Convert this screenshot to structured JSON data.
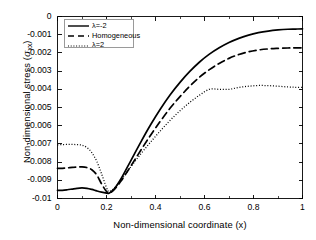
{
  "chart_data": {
    "type": "line",
    "title": "",
    "xlabel": "Non-dimensional coordinate (x)",
    "ylabel_prefix": "Non-dimensional stress (",
    "ylabel_symbol": "σ",
    "ylabel_subscript": "xx",
    "ylabel_suffix": ")",
    "ylabel_full": "Non-dimensional stress (σxx)",
    "xlim": [
      0,
      1
    ],
    "ylim": [
      -0.01,
      0
    ],
    "grid": false,
    "legend_position": "upper left",
    "xticks": [
      "0",
      "0.2",
      "0.4",
      "0.6",
      "0.8",
      "1"
    ],
    "xtick_values": [
      0,
      0.2,
      0.4,
      0.6,
      0.8,
      1
    ],
    "yticks": [
      "0",
      "-0.001",
      "-0.002",
      "-0.003",
      "-0.004",
      "-0.005",
      "-0.006",
      "-0.007",
      "-0.008",
      "-0.009",
      "-0.01"
    ],
    "ytick_values": [
      0,
      -0.001,
      -0.002,
      -0.003,
      -0.004,
      -0.005,
      -0.006,
      -0.007,
      -0.008,
      -0.009,
      -0.01
    ],
    "series": [
      {
        "name": "λ=-2",
        "style": "solid",
        "color": "#000000",
        "x": [
          0,
          0.02,
          0.04,
          0.06,
          0.08,
          0.1,
          0.12,
          0.14,
          0.16,
          0.18,
          0.2,
          0.21,
          0.23,
          0.26,
          0.3,
          0.34,
          0.38,
          0.42,
          0.46,
          0.5,
          0.54,
          0.58,
          0.62,
          0.66,
          0.7,
          0.74,
          0.78,
          0.82,
          0.86,
          0.9,
          0.94,
          0.97,
          1.0
        ],
        "y": [
          -0.00955,
          -0.00955,
          -0.00952,
          -0.00948,
          -0.00944,
          -0.00942,
          -0.00944,
          -0.0095,
          -0.00958,
          -0.00965,
          -0.0097,
          -0.00971,
          -0.0095,
          -0.0089,
          -0.0079,
          -0.0069,
          -0.00595,
          -0.00508,
          -0.0043,
          -0.00362,
          -0.00302,
          -0.0025,
          -0.00207,
          -0.00172,
          -0.00143,
          -0.0012,
          -0.00102,
          -0.00089,
          -0.0008,
          -0.00074,
          -0.0007,
          -0.00069,
          -0.00068
        ]
      },
      {
        "name": "Homogeneous",
        "style": "dashed",
        "color": "#000000",
        "x": [
          0,
          0.02,
          0.04,
          0.06,
          0.08,
          0.1,
          0.12,
          0.14,
          0.16,
          0.18,
          0.2,
          0.21,
          0.23,
          0.26,
          0.3,
          0.34,
          0.38,
          0.42,
          0.46,
          0.5,
          0.54,
          0.58,
          0.62,
          0.66,
          0.7,
          0.74,
          0.78,
          0.82,
          0.86,
          0.9,
          0.94,
          0.97,
          1.0
        ],
        "y": [
          -0.00835,
          -0.00834,
          -0.00832,
          -0.00829,
          -0.00827,
          -0.00826,
          -0.0083,
          -0.00842,
          -0.0087,
          -0.0092,
          -0.00962,
          -0.0097,
          -0.00953,
          -0.00903,
          -0.0082,
          -0.00735,
          -0.00652,
          -0.00575,
          -0.00503,
          -0.0044,
          -0.00383,
          -0.00333,
          -0.00292,
          -0.00258,
          -0.0023,
          -0.00209,
          -0.00194,
          -0.00184,
          -0.00178,
          -0.00175,
          -0.00173,
          -0.00172,
          -0.00172
        ]
      },
      {
        "name": "λ=2",
        "style": "dotted",
        "color": "#000000",
        "x": [
          0,
          0.02,
          0.04,
          0.06,
          0.08,
          0.1,
          0.12,
          0.14,
          0.16,
          0.18,
          0.2,
          0.21,
          0.23,
          0.26,
          0.3,
          0.34,
          0.38,
          0.42,
          0.46,
          0.5,
          0.54,
          0.58,
          0.62,
          0.66,
          0.7,
          0.74,
          0.78,
          0.82,
          0.86,
          0.9,
          0.94,
          0.97,
          1.0
        ],
        "y": [
          -0.00705,
          -0.00704,
          -0.00703,
          -0.00703,
          -0.00704,
          -0.00707,
          -0.0072,
          -0.00748,
          -0.00795,
          -0.00865,
          -0.0094,
          -0.00962,
          -0.00945,
          -0.00898,
          -0.00825,
          -0.00755,
          -0.0069,
          -0.00628,
          -0.0057,
          -0.00518,
          -0.00472,
          -0.00432,
          -0.004,
          -0.006,
          -0.004,
          -0.0039,
          -0.00383,
          -0.00379,
          -0.0038,
          -0.00383,
          -0.00387,
          -0.00389,
          -0.0039
        ]
      }
    ]
  },
  "legend": {
    "entries": [
      {
        "label": "λ=-2",
        "style": "solid"
      },
      {
        "label": "Homogeneous",
        "style": "dashed"
      },
      {
        "label": "λ=2",
        "style": "dotted"
      }
    ]
  }
}
